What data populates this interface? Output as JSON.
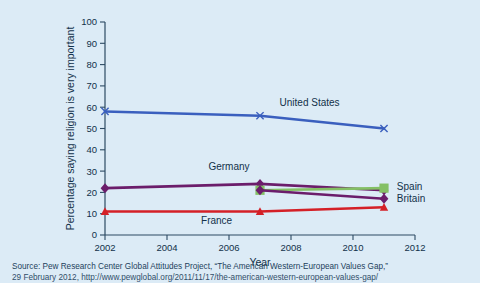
{
  "chart_data": {
    "type": "line",
    "title": "",
    "xlabel": "Year",
    "ylabel": "Percentage saying religion is very important",
    "xlim": [
      2002,
      2012
    ],
    "ylim": [
      0,
      100
    ],
    "xticks": [
      2002,
      2004,
      2006,
      2008,
      2010,
      2012
    ],
    "yticks": [
      0,
      10,
      20,
      30,
      40,
      50,
      60,
      70,
      80,
      90,
      100
    ],
    "grid": false,
    "legend_position": "inline-labels",
    "series": [
      {
        "name": "United States",
        "color": "#3a5fbe",
        "marker": "x",
        "x": [
          2002,
          2007,
          2011
        ],
        "values": [
          58,
          56,
          50
        ],
        "label_x": 2008.6,
        "label_y": 62
      },
      {
        "name": "Germany",
        "color": "#6b1d6b",
        "marker": "diamond",
        "x": [
          2002,
          2007,
          2011
        ],
        "values": [
          22,
          24,
          21
        ],
        "label_x": 2006.0,
        "label_y": 32
      },
      {
        "name": "Spain",
        "color": "#84c065",
        "marker": "square",
        "x": [
          2007,
          2011
        ],
        "values": [
          21,
          22
        ],
        "label_x": 2011.35,
        "label_y": 23
      },
      {
        "name": "Britain",
        "color": "#6b1d6b",
        "marker": "diamond",
        "x": [
          2007,
          2011
        ],
        "values": [
          21,
          17
        ],
        "label_x": 2011.35,
        "label_y": 17
      },
      {
        "name": "France",
        "color": "#d42027",
        "marker": "triangle",
        "x": [
          2002,
          2007,
          2011
        ],
        "values": [
          11,
          11,
          13
        ],
        "label_x": 2005.6,
        "label_y": 7
      }
    ]
  },
  "source": {
    "line1": "Source: Pew Research Center Global Attitudes Project, “The American Western-European Values Gap,”",
    "line2": "29 February 2012, http://www.pewglobal.org/2011/11/17/the-american-western-european-values-gap/"
  },
  "colors": {
    "background": "#dcebf6",
    "axis": "#2c4a63",
    "text": "#12314a"
  }
}
